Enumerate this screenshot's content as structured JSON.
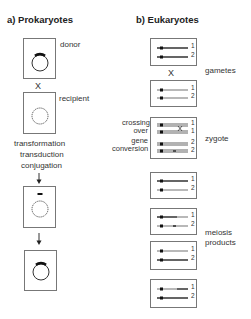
{
  "panel_a": {
    "title": "a)  Prokaryotes",
    "donor_label": "donor",
    "cross_symbol": "X",
    "recipient_label": "recipient",
    "mechanisms": [
      "transformation",
      "transduction",
      "conjugation"
    ]
  },
  "panel_b": {
    "title": "b)  Eukaryotes",
    "cross_symbol": "X",
    "gametes_label": "gametes",
    "zygote_label": "zygote",
    "crossing_over_label": [
      "crossing",
      "over"
    ],
    "gene_conversion_label": [
      "gene",
      "conversion"
    ],
    "meiosis_products_label": [
      "meiosis",
      "products"
    ],
    "chromosome_numbers": {
      "gamete1": [
        "1",
        "2"
      ],
      "gamete2": [
        "1",
        "2"
      ],
      "zygote": [
        "1",
        "1",
        "2",
        "2"
      ],
      "product1": [
        "1",
        "2"
      ],
      "product2": [
        "1",
        "2"
      ],
      "product3": [
        "1",
        "2"
      ],
      "product4": [
        "1",
        "2"
      ]
    }
  }
}
